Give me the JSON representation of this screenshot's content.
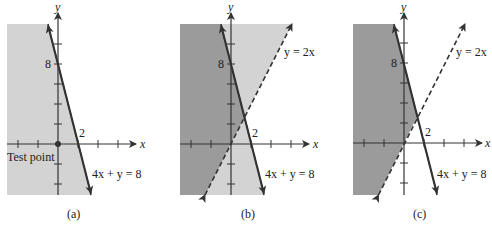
{
  "figure": {
    "panels": [
      {
        "id": "a",
        "caption": "(a)",
        "axis_x_label": "x",
        "axis_y_label": "y",
        "y_tick_label": "8",
        "x_tick_label": "2",
        "line_solid_label": "4x + y = 8",
        "annotation": "Test point",
        "shading": "half-plane 4x + y ≤ 8 (light gray)"
      },
      {
        "id": "b",
        "caption": "(b)",
        "axis_x_label": "x",
        "axis_y_label": "y",
        "y_tick_label": "8",
        "x_tick_label": "2",
        "line_solid_label": "4x + y = 8",
        "line_dashed_label": "y = 2x",
        "shading": "both half-planes light gray; overlap dark gray"
      },
      {
        "id": "c",
        "caption": "(c)",
        "axis_x_label": "x",
        "axis_y_label": "y",
        "y_tick_label": "8",
        "x_tick_label": "2",
        "line_solid_label": "4x + y = 8",
        "line_dashed_label": "y = 2x",
        "shading": "solution region 4x + y ≤ 8 and y > 2x (dark gray)"
      }
    ],
    "colors": {
      "light_shade": "#d3d3d3",
      "dark_shade": "#9b9b9b",
      "line": "#333333"
    }
  }
}
